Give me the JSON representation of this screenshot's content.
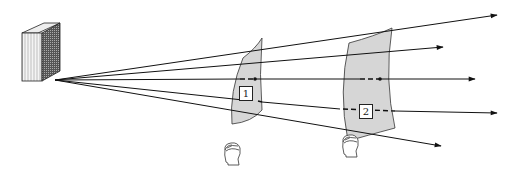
{
  "diagram": {
    "type": "inverse-square-law illustration",
    "source": {
      "name": "light source block",
      "x": 52,
      "y": 80
    },
    "rays": [
      {
        "id": "ray-top",
        "end": [
          497,
          15
        ]
      },
      {
        "id": "ray-upper",
        "end": [
          443,
          47
        ]
      },
      {
        "id": "ray-center",
        "end": [
          475,
          79
        ]
      },
      {
        "id": "ray-lower",
        "end": [
          497,
          113
        ]
      },
      {
        "id": "ray-bottom",
        "end": [
          441,
          146
        ]
      }
    ],
    "surfaces": [
      {
        "label": "1",
        "fill": "#d6d6d6"
      },
      {
        "label": "2",
        "fill": "#d6d6d6"
      }
    ],
    "observers": [
      {
        "name": "observer-1",
        "x": 222,
        "y": 142
      },
      {
        "name": "observer-2",
        "x": 340,
        "y": 134
      }
    ],
    "colors": {
      "line": "#111111",
      "surface": "#d6d6d6",
      "background": "#ffffff"
    }
  }
}
